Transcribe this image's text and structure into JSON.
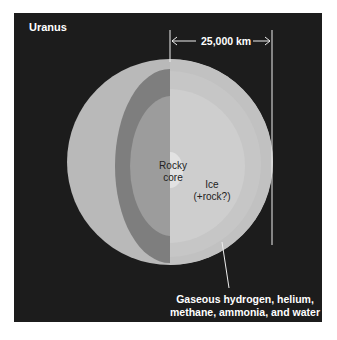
{
  "title": "Uranus",
  "dimension": {
    "label": "25,000 km"
  },
  "layers": {
    "rocky_core": {
      "line1": "Rocky",
      "line2": "core"
    },
    "ice": {
      "line1": "Ice",
      "line2": "(+rock?)"
    },
    "gas": {
      "line1": "Gaseous hydrogen, helium,",
      "line2": "methane, ammonia, and water"
    }
  },
  "colors": {
    "background": "#1c1c1c",
    "outer_shell": "#b9b9b9",
    "dark_band": "#7e7e7e",
    "mid_layer": "#9c9c9c",
    "ice": "#cecece",
    "core": "#e2e2e2"
  }
}
